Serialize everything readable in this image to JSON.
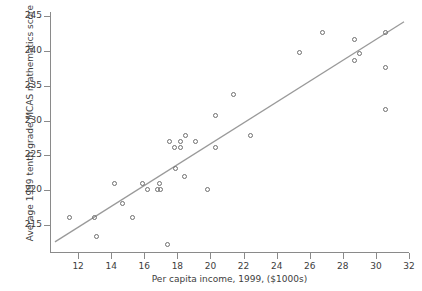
{
  "chart_data": {
    "type": "scatter",
    "title": "",
    "xlabel": "Per capita income, 1999, ($1000s)",
    "ylabel": "Average 1999 tenth grade MCAS mathematics score",
    "xlim": [
      10.3,
      32.0
    ],
    "ylim": [
      211.0,
      245.6
    ],
    "xticks": [
      12,
      14,
      16,
      18,
      20,
      22,
      24,
      26,
      28,
      30,
      32
    ],
    "yticks": [
      215,
      220,
      225,
      230,
      235,
      240,
      245
    ],
    "xtick_labels": [
      "12",
      "14",
      "16",
      "18",
      "20",
      "22",
      "24",
      "26",
      "28",
      "30",
      "32"
    ],
    "ytick_labels": [
      "215",
      "220",
      "225",
      "230",
      "235",
      "240",
      "245"
    ],
    "grid": false,
    "legend": null,
    "marker": "open-circle",
    "marker_color": "#6f6f6f",
    "line_color": "#9a9a9a",
    "points": [
      {
        "x": 11.5,
        "y": 216.1
      },
      {
        "x": 13.0,
        "y": 216.1
      },
      {
        "x": 13.1,
        "y": 213.3
      },
      {
        "x": 14.2,
        "y": 221.0
      },
      {
        "x": 14.7,
        "y": 218.1
      },
      {
        "x": 15.3,
        "y": 216.1
      },
      {
        "x": 15.9,
        "y": 221.0
      },
      {
        "x": 16.2,
        "y": 220.1
      },
      {
        "x": 16.8,
        "y": 220.1
      },
      {
        "x": 17.0,
        "y": 220.1
      },
      {
        "x": 16.9,
        "y": 221.0
      },
      {
        "x": 17.4,
        "y": 212.2
      },
      {
        "x": 17.5,
        "y": 227.0
      },
      {
        "x": 17.8,
        "y": 226.1
      },
      {
        "x": 17.9,
        "y": 223.1
      },
      {
        "x": 18.2,
        "y": 226.1
      },
      {
        "x": 18.2,
        "y": 227.0
      },
      {
        "x": 18.5,
        "y": 227.9
      },
      {
        "x": 18.4,
        "y": 222.0
      },
      {
        "x": 19.1,
        "y": 227.0
      },
      {
        "x": 19.8,
        "y": 220.1
      },
      {
        "x": 20.3,
        "y": 230.8
      },
      {
        "x": 20.3,
        "y": 226.1
      },
      {
        "x": 21.4,
        "y": 233.7
      },
      {
        "x": 22.4,
        "y": 227.9
      },
      {
        "x": 25.4,
        "y": 239.8
      },
      {
        "x": 26.8,
        "y": 242.7
      },
      {
        "x": 28.7,
        "y": 241.6
      },
      {
        "x": 28.7,
        "y": 238.6
      },
      {
        "x": 29.0,
        "y": 239.7
      },
      {
        "x": 30.6,
        "y": 242.6
      },
      {
        "x": 30.6,
        "y": 237.7
      },
      {
        "x": 30.6,
        "y": 231.6
      }
    ],
    "trendline": {
      "x1": 10.6,
      "y1": 212.6,
      "x2": 31.7,
      "y2": 244.2
    }
  }
}
